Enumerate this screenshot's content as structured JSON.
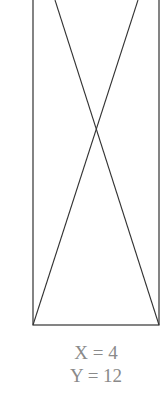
{
  "diagram": {
    "shape": "rectangle-with-crossed-diagonals",
    "rect": {
      "left": 33,
      "right": 159,
      "top": -5,
      "bottom": 325
    },
    "stroke_color": "#333333",
    "lines": [
      {
        "x1": 55,
        "y1": 0,
        "x2": 159,
        "y2": 325
      },
      {
        "x1": 138,
        "y1": 0,
        "x2": 33,
        "y2": 325
      }
    ],
    "labels": {
      "x": "X = 4",
      "y": "Y = 12"
    },
    "label_color": "#8a8a8a"
  }
}
